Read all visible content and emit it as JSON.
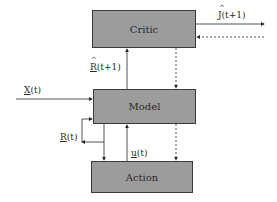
{
  "diagram": {
    "type": "adaptive critic block diagram",
    "colors": {
      "box_fill": "#9c9c9c",
      "box_border": "#3a3a3a",
      "line": "#2a2a2a"
    },
    "blocks": {
      "critic": {
        "label": "Critic"
      },
      "model": {
        "label": "Model"
      },
      "action": {
        "label": "Action"
      }
    },
    "signals": {
      "j_hat": {
        "symbol": "J",
        "arg": "(t+1)"
      },
      "r_hat": {
        "symbol": "R",
        "arg": "(t+1)"
      },
      "x": {
        "symbol": "X",
        "arg": "(t)"
      },
      "r": {
        "symbol": "R",
        "arg": "(t)"
      },
      "u": {
        "symbol": "u",
        "arg": "(t)"
      }
    }
  }
}
